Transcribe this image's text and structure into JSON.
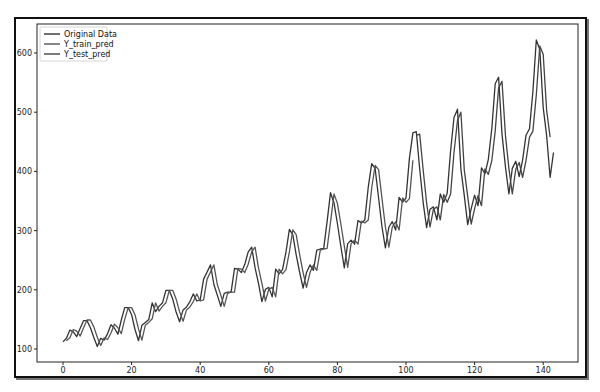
{
  "chart_data": {
    "type": "line",
    "title": "",
    "xlabel": "",
    "ylabel": "",
    "xlim": [
      -7,
      150
    ],
    "ylim": [
      78,
      644
    ],
    "xticks": [
      0,
      20,
      40,
      60,
      80,
      100,
      120,
      140
    ],
    "yticks": [
      100,
      200,
      300,
      400,
      500,
      600
    ],
    "grid": false,
    "legend_position": "upper left",
    "legend": [
      "Original Data",
      "Y_train_pred",
      "Y_test_pred"
    ],
    "series": [
      {
        "name": "Original Data",
        "color": "#333333",
        "x_start": 0,
        "values": [
          112,
          118,
          132,
          129,
          121,
          135,
          148,
          148,
          136,
          119,
          104,
          118,
          115,
          126,
          141,
          135,
          125,
          149,
          170,
          170,
          158,
          133,
          114,
          140,
          145,
          150,
          178,
          163,
          172,
          178,
          199,
          199,
          184,
          162,
          146,
          166,
          171,
          180,
          193,
          181,
          183,
          218,
          230,
          242,
          209,
          191,
          172,
          194,
          196,
          196,
          236,
          235,
          229,
          243,
          264,
          272,
          237,
          211,
          180,
          201,
          204,
          188,
          235,
          227,
          234,
          264,
          302,
          293,
          259,
          229,
          203,
          229,
          242,
          233,
          267,
          269,
          270,
          315,
          364,
          347,
          312,
          274,
          237,
          278,
          284,
          277,
          317,
          313,
          318,
          374,
          413,
          405,
          355,
          306,
          271,
          306,
          315,
          301,
          356,
          348,
          355,
          422,
          465,
          467,
          404,
          347,
          305,
          336,
          340,
          318,
          362,
          348,
          363,
          435,
          491,
          505,
          404,
          359,
          310,
          337,
          360,
          342,
          406,
          396,
          420,
          472,
          548,
          559,
          463,
          407,
          362,
          405,
          417,
          391,
          419,
          461,
          472,
          535,
          622,
          606,
          508,
          461,
          390,
          432
        ]
      },
      {
        "name": "Y_train_pred",
        "color": "#555555",
        "x_start": 1,
        "values": [
          114,
          119,
          133,
          130,
          122,
          136,
          149,
          149,
          137,
          120,
          106,
          119,
          116,
          127,
          142,
          136,
          126,
          150,
          170,
          170,
          158,
          134,
          115,
          140,
          145,
          151,
          178,
          164,
          172,
          178,
          199,
          199,
          184,
          163,
          147,
          166,
          171,
          180,
          193,
          181,
          183,
          218,
          230,
          242,
          209,
          191,
          172,
          194,
          196,
          196,
          236,
          235,
          229,
          243,
          264,
          272,
          237,
          211,
          181,
          201,
          204,
          188,
          235,
          227,
          234,
          264,
          301,
          293,
          259,
          229,
          204,
          229,
          242,
          233,
          267,
          269,
          270,
          314,
          362,
          346,
          312,
          274,
          238,
          278,
          284,
          277,
          316,
          313,
          318,
          372,
          410,
          403,
          354,
          306,
          272,
          306,
          315,
          301,
          355,
          348,
          354,
          419
        ]
      },
      {
        "name": "Y_test_pred",
        "color": "#444444",
        "x_start": 103,
        "values": [
          461,
          463,
          402,
          347,
          306,
          336,
          340,
          318,
          361,
          348,
          362,
          432,
          486,
          500,
          402,
          358,
          311,
          337,
          359,
          342,
          404,
          395,
          418,
          468,
          541,
          552,
          460,
          405,
          362,
          404,
          415,
          390,
          418,
          458,
          468,
          529,
          612,
          598,
          504,
          458
        ]
      }
    ]
  }
}
